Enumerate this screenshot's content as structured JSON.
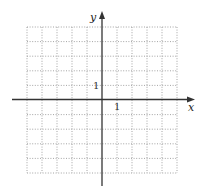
{
  "diagram": {
    "type": "coordinate-grid",
    "x_axis_label": "x",
    "y_axis_label": "y",
    "x_tick_label": "1",
    "y_tick_label": "1",
    "grid": {
      "columns": 10,
      "rows": 10,
      "x_range": [
        -5,
        5
      ],
      "y_range": [
        -5,
        5
      ],
      "style": "dotted"
    },
    "colors": {
      "grid": "#9a9a9a",
      "axis": "#333333",
      "background": "#ffffff"
    }
  }
}
